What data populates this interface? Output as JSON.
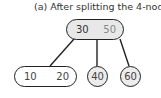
{
  "title": "(a) After splitting the 4-node",
  "tree": {
    "root": {
      "keys": [
        "30",
        "50"
      ],
      "fill": "#e8e8e8"
    },
    "children": [
      {
        "keys": [
          "10",
          "20"
        ],
        "fill": "#ffffff"
      },
      {
        "keys": [
          "40"
        ],
        "fill": "#ececec"
      },
      {
        "keys": [
          "60"
        ],
        "fill": "#ececec"
      }
    ]
  },
  "colors": {
    "stroke": "#222222",
    "text": "#444444",
    "muted_key": "#888888"
  }
}
